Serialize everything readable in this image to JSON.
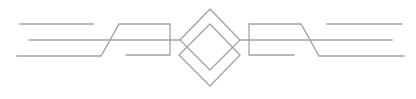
{
  "ornament": {
    "name": "symmetric line divider with double diamond",
    "stroke_color": "#a3a3a3",
    "background_color": "#ffffff",
    "elements": [
      {
        "id": "left-top-line",
        "kind": "line"
      },
      {
        "id": "left-middle-line",
        "kind": "line"
      },
      {
        "id": "left-zigzag",
        "kind": "polyline"
      },
      {
        "id": "right-top-line",
        "kind": "line"
      },
      {
        "id": "right-middle-line",
        "kind": "line"
      },
      {
        "id": "right-zigzag",
        "kind": "polyline"
      },
      {
        "id": "upper-diamond",
        "kind": "polygon"
      },
      {
        "id": "lower-diamond",
        "kind": "polygon"
      }
    ]
  }
}
